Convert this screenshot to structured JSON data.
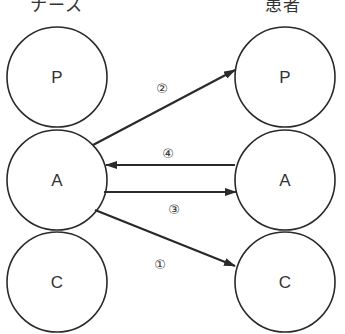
{
  "columns": {
    "left": {
      "title": "ナース"
    },
    "right": {
      "title": "患者"
    }
  },
  "nodes": {
    "left": [
      {
        "id": "nurse-P",
        "label": "P",
        "cx": 57,
        "cy": 77
      },
      {
        "id": "nurse-A",
        "label": "A",
        "cx": 57,
        "cy": 180
      },
      {
        "id": "nurse-C",
        "label": "C",
        "cx": 57,
        "cy": 282
      }
    ],
    "right": [
      {
        "id": "patient-P",
        "label": "P",
        "cx": 285,
        "cy": 77
      },
      {
        "id": "patient-A",
        "label": "A",
        "cx": 285,
        "cy": 180
      },
      {
        "id": "patient-C",
        "label": "C",
        "cx": 285,
        "cy": 282
      }
    ],
    "radius": 50
  },
  "arrows": [
    {
      "step": "①",
      "from": "nurse-A",
      "to": "patient-C",
      "label_pos": [
        168,
        266
      ]
    },
    {
      "step": "②",
      "from": "nurse-A",
      "to": "patient-P",
      "label_pos": [
        162,
        88
      ]
    },
    {
      "step": "③",
      "from": "nurse-A",
      "to": "patient-A",
      "label_pos": [
        174,
        212
      ]
    },
    {
      "step": "④",
      "from": "patient-A",
      "to": "nurse-A",
      "label_pos": [
        168,
        156
      ]
    }
  ],
  "colors": {
    "stroke": "#2a2a2a",
    "text": "#333333",
    "background": "#ffffff"
  }
}
